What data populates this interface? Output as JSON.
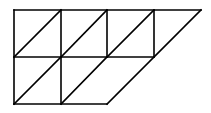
{
  "diagram": {
    "stroke_color": "#000000",
    "background_color": "#ffffff",
    "lines": [
      {
        "id": "top-edge",
        "x1": 14,
        "y1": 10,
        "x2": 201,
        "y2": 10
      },
      {
        "id": "middle-line",
        "x1": 14,
        "y1": 57,
        "x2": 154,
        "y2": 57
      },
      {
        "id": "bottom-edge",
        "x1": 14,
        "y1": 104,
        "x2": 107,
        "y2": 104
      },
      {
        "id": "vertical-1",
        "x1": 14,
        "y1": 10,
        "x2": 14,
        "y2": 104
      },
      {
        "id": "vertical-2",
        "x1": 61,
        "y1": 10,
        "x2": 61,
        "y2": 104
      },
      {
        "id": "vertical-3",
        "x1": 107,
        "y1": 10,
        "x2": 107,
        "y2": 57
      },
      {
        "id": "vertical-4",
        "x1": 154,
        "y1": 10,
        "x2": 154,
        "y2": 57
      },
      {
        "id": "diagonal-top-1",
        "x1": 14,
        "y1": 57,
        "x2": 61,
        "y2": 10
      },
      {
        "id": "diagonal-top-2",
        "x1": 61,
        "y1": 57,
        "x2": 107,
        "y2": 10
      },
      {
        "id": "diagonal-top-3",
        "x1": 107,
        "y1": 57,
        "x2": 154,
        "y2": 10
      },
      {
        "id": "diagonal-bottom-1",
        "x1": 14,
        "y1": 104,
        "x2": 61,
        "y2": 57
      },
      {
        "id": "diagonal-bottom-2",
        "x1": 61,
        "y1": 104,
        "x2": 107,
        "y2": 57
      },
      {
        "id": "slanted-right-edge",
        "x1": 107,
        "y1": 104,
        "x2": 201,
        "y2": 10
      }
    ]
  }
}
